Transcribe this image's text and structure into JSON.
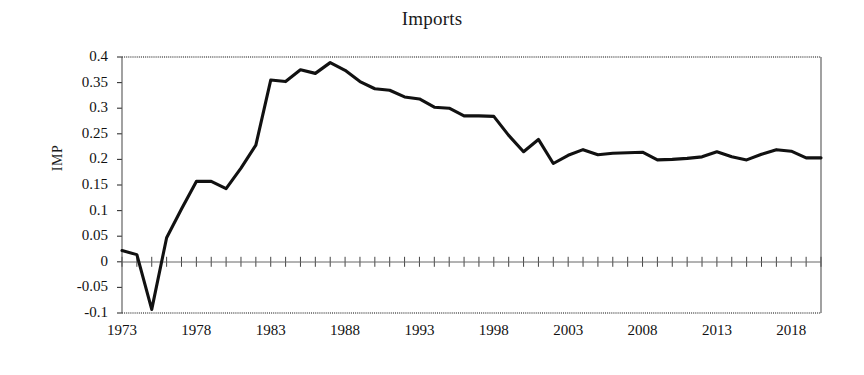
{
  "chart_data": {
    "type": "line",
    "title": "Imports",
    "xlabel": "",
    "ylabel": "IMP",
    "series_name": "IMP",
    "line_color": "#111111",
    "grid": true,
    "legend": "none",
    "xlim": [
      1973,
      2020
    ],
    "ylim": [
      -0.1,
      0.4
    ],
    "ytick_labels": [
      "0.4",
      "0.35",
      "0.3",
      "0.25",
      "0.2",
      "0.15",
      "0.1",
      "0.05",
      "0",
      "-0.05",
      "-0.1"
    ],
    "ytick_values": [
      0.4,
      0.35,
      0.3,
      0.25,
      0.2,
      0.15,
      0.1,
      0.05,
      0,
      -0.05,
      -0.1
    ],
    "xtick_labels": [
      "1973",
      "1978",
      "1983",
      "1988",
      "1993",
      "1998",
      "2003",
      "2008",
      "2013",
      "2018"
    ],
    "xtick_values": [
      1973,
      1978,
      1983,
      1988,
      1993,
      1998,
      2003,
      2008,
      2013,
      2018
    ],
    "x": [
      1973,
      1974,
      1975,
      1976,
      1977,
      1978,
      1979,
      1980,
      1981,
      1982,
      1983,
      1984,
      1985,
      1986,
      1987,
      1988,
      1989,
      1990,
      1991,
      1992,
      1993,
      1994,
      1995,
      1996,
      1997,
      1998,
      1999,
      2000,
      2001,
      2002,
      2003,
      2004,
      2005,
      2006,
      2007,
      2008,
      2009,
      2010,
      2011,
      2012,
      2013,
      2014,
      2015,
      2016,
      2017,
      2018,
      2019,
      2020
    ],
    "values": [
      0.022,
      0.014,
      -0.093,
      0.047,
      0.103,
      0.157,
      0.157,
      0.143,
      0.183,
      0.228,
      0.355,
      0.352,
      0.375,
      0.368,
      0.389,
      0.374,
      0.352,
      0.338,
      0.335,
      0.322,
      0.318,
      0.302,
      0.3,
      0.285,
      0.285,
      0.284,
      0.247,
      0.215,
      0.239,
      0.192,
      0.208,
      0.219,
      0.209,
      0.212,
      0.213,
      0.214,
      0.199,
      0.2,
      0.202,
      0.205,
      0.215,
      0.205,
      0.199,
      0.21,
      0.219,
      0.216,
      0.203,
      0.203
    ]
  },
  "axes": {
    "plot_left": 122,
    "plot_right": 821,
    "plot_top": 57,
    "plot_bottom": 313
  }
}
